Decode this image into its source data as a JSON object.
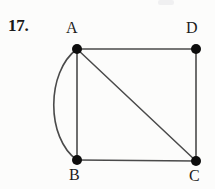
{
  "page": {
    "background_color": "#fdfdfc",
    "width": 215,
    "height": 189
  },
  "exercise": {
    "number_label": "17.",
    "number_color": "#191919"
  },
  "graph": {
    "stroke_color": "#4a4a4a",
    "vertex_color": "#0d0d0d",
    "vertex_radius": 5,
    "edge_width": 1.6,
    "vertices": [
      {
        "id": "A",
        "label": "A",
        "x": 77,
        "y": 49
      },
      {
        "id": "D",
        "label": "D",
        "x": 196,
        "y": 49
      },
      {
        "id": "B",
        "label": "B",
        "x": 77,
        "y": 160
      },
      {
        "id": "C",
        "label": "C",
        "x": 196,
        "y": 161
      }
    ],
    "edges": [
      {
        "id": "AD",
        "from": "A",
        "to": "D",
        "kind": "straight"
      },
      {
        "id": "AB-straight",
        "from": "A",
        "to": "B",
        "kind": "straight"
      },
      {
        "id": "AB-curved",
        "from": "A",
        "to": "B",
        "kind": "arc",
        "bulge_x": 52
      },
      {
        "id": "AC",
        "from": "A",
        "to": "C",
        "kind": "straight"
      },
      {
        "id": "DC",
        "from": "D",
        "to": "C",
        "kind": "straight"
      },
      {
        "id": "BC",
        "from": "B",
        "to": "C",
        "kind": "straight"
      }
    ]
  }
}
